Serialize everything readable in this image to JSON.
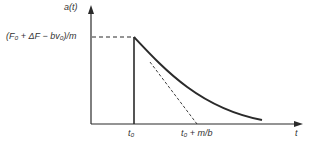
{
  "diagram": {
    "y_axis_label": "a(t)",
    "x_axis_label": "t",
    "level_label": "(F₀ + ΔF − bv₀)/m",
    "tick_t0": "t₀",
    "tick_t0_mb": "t₀ + m/b",
    "colors": {
      "line": "#2a2a2a",
      "background": "#ffffff"
    }
  }
}
